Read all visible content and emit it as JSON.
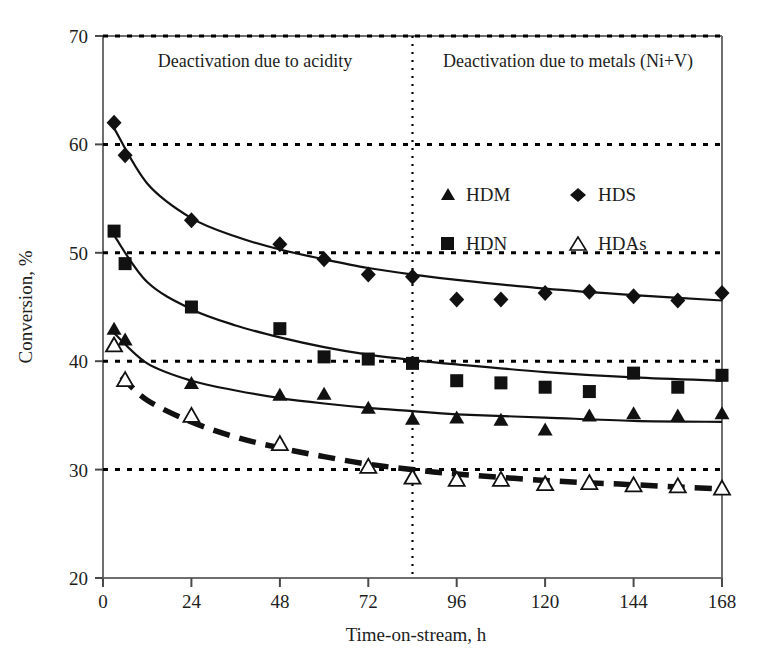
{
  "chart_data": {
    "type": "scatter",
    "title": "",
    "xlabel": "Time-on-stream, h",
    "ylabel": "Conversion, %",
    "xlim": [
      0,
      168
    ],
    "ylim": [
      20,
      70
    ],
    "xticks": [
      0,
      24,
      48,
      72,
      96,
      120,
      144,
      168
    ],
    "yticks": [
      20,
      30,
      40,
      50,
      60,
      70
    ],
    "grid": "horizontal dotted at 30, 40, 50, 60, 70",
    "legend_position": "upper-center-right",
    "annotations": [
      {
        "text": "Deactivation due to acidity",
        "x_range": [
          0,
          84
        ],
        "at_x": 42,
        "at_y": 66.5
      },
      {
        "text": "Deactivation due to metals (Ni+V)",
        "x_range": [
          84,
          168
        ],
        "at_x": 126,
        "at_y": 66.5
      }
    ],
    "divider": {
      "type": "vertical-dotted",
      "x": 84
    },
    "series": [
      {
        "name": "HDM",
        "marker": "filled-triangle",
        "trendline": "solid",
        "points": [
          {
            "x": 3,
            "y": 43.0
          },
          {
            "x": 6,
            "y": 42.0
          },
          {
            "x": 24,
            "y": 38.0
          },
          {
            "x": 48,
            "y": 36.9
          },
          {
            "x": 60,
            "y": 37.0
          },
          {
            "x": 72,
            "y": 35.7
          },
          {
            "x": 84,
            "y": 34.7
          },
          {
            "x": 96,
            "y": 34.8
          },
          {
            "x": 108,
            "y": 34.6
          },
          {
            "x": 120,
            "y": 33.7
          },
          {
            "x": 132,
            "y": 35.0
          },
          {
            "x": 144,
            "y": 35.2
          },
          {
            "x": 156,
            "y": 35.0
          },
          {
            "x": 168,
            "y": 35.2
          }
        ],
        "fit": [
          {
            "x": 3,
            "y": 42.6
          },
          {
            "x": 12,
            "y": 39.8
          },
          {
            "x": 24,
            "y": 38.2
          },
          {
            "x": 36,
            "y": 37.3
          },
          {
            "x": 48,
            "y": 36.6
          },
          {
            "x": 60,
            "y": 36.1
          },
          {
            "x": 72,
            "y": 35.7
          },
          {
            "x": 84,
            "y": 35.4
          },
          {
            "x": 96,
            "y": 35.1
          },
          {
            "x": 120,
            "y": 34.8
          },
          {
            "x": 144,
            "y": 34.5
          },
          {
            "x": 168,
            "y": 34.4
          }
        ]
      },
      {
        "name": "HDS",
        "marker": "filled-diamond",
        "trendline": "solid",
        "points": [
          {
            "x": 3,
            "y": 62.0
          },
          {
            "x": 6,
            "y": 59.0
          },
          {
            "x": 24,
            "y": 53.0
          },
          {
            "x": 48,
            "y": 50.8
          },
          {
            "x": 60,
            "y": 49.4
          },
          {
            "x": 72,
            "y": 48.0
          },
          {
            "x": 84,
            "y": 47.8
          },
          {
            "x": 96,
            "y": 45.7
          },
          {
            "x": 108,
            "y": 45.7
          },
          {
            "x": 120,
            "y": 46.3
          },
          {
            "x": 132,
            "y": 46.4
          },
          {
            "x": 144,
            "y": 46.0
          },
          {
            "x": 156,
            "y": 45.6
          },
          {
            "x": 168,
            "y": 46.3
          }
        ],
        "fit": [
          {
            "x": 3,
            "y": 61.5
          },
          {
            "x": 12,
            "y": 56.4
          },
          {
            "x": 24,
            "y": 53.2
          },
          {
            "x": 36,
            "y": 51.5
          },
          {
            "x": 48,
            "y": 50.3
          },
          {
            "x": 60,
            "y": 49.4
          },
          {
            "x": 72,
            "y": 48.6
          },
          {
            "x": 84,
            "y": 48.0
          },
          {
            "x": 96,
            "y": 47.5
          },
          {
            "x": 120,
            "y": 46.7
          },
          {
            "x": 144,
            "y": 46.1
          },
          {
            "x": 168,
            "y": 45.6
          }
        ]
      },
      {
        "name": "HDN",
        "marker": "filled-square",
        "trendline": "solid",
        "points": [
          {
            "x": 3,
            "y": 52.0
          },
          {
            "x": 6,
            "y": 49.0
          },
          {
            "x": 24,
            "y": 45.0
          },
          {
            "x": 48,
            "y": 43.0
          },
          {
            "x": 60,
            "y": 40.4
          },
          {
            "x": 72,
            "y": 40.2
          },
          {
            "x": 84,
            "y": 39.8
          },
          {
            "x": 96,
            "y": 38.2
          },
          {
            "x": 108,
            "y": 38.0
          },
          {
            "x": 120,
            "y": 37.6
          },
          {
            "x": 132,
            "y": 37.2
          },
          {
            "x": 144,
            "y": 38.9
          },
          {
            "x": 156,
            "y": 37.6
          },
          {
            "x": 168,
            "y": 38.7
          }
        ],
        "fit": [
          {
            "x": 3,
            "y": 51.6
          },
          {
            "x": 12,
            "y": 47.3
          },
          {
            "x": 24,
            "y": 44.8
          },
          {
            "x": 36,
            "y": 43.3
          },
          {
            "x": 48,
            "y": 42.2
          },
          {
            "x": 60,
            "y": 41.3
          },
          {
            "x": 72,
            "y": 40.6
          },
          {
            "x": 84,
            "y": 40.1
          },
          {
            "x": 96,
            "y": 39.7
          },
          {
            "x": 120,
            "y": 39.0
          },
          {
            "x": 144,
            "y": 38.5
          },
          {
            "x": 168,
            "y": 38.2
          }
        ]
      },
      {
        "name": "HDAs",
        "marker": "open-triangle",
        "trendline": "dashed",
        "points": [
          {
            "x": 3,
            "y": 41.5
          },
          {
            "x": 6,
            "y": 38.3
          },
          {
            "x": 24,
            "y": 35.0
          },
          {
            "x": 48,
            "y": 32.4
          },
          {
            "x": 72,
            "y": 30.3
          },
          {
            "x": 84,
            "y": 29.3
          },
          {
            "x": 96,
            "y": 29.1
          },
          {
            "x": 108,
            "y": 29.1
          },
          {
            "x": 120,
            "y": 28.7
          },
          {
            "x": 132,
            "y": 28.8
          },
          {
            "x": 144,
            "y": 28.6
          },
          {
            "x": 156,
            "y": 28.5
          },
          {
            "x": 168,
            "y": 28.3
          }
        ],
        "fit": [
          {
            "x": 5,
            "y": 38.6
          },
          {
            "x": 12,
            "y": 36.4
          },
          {
            "x": 24,
            "y": 34.4
          },
          {
            "x": 36,
            "y": 33.0
          },
          {
            "x": 48,
            "y": 32.0
          },
          {
            "x": 60,
            "y": 31.2
          },
          {
            "x": 72,
            "y": 30.5
          },
          {
            "x": 84,
            "y": 30.0
          },
          {
            "x": 96,
            "y": 29.6
          },
          {
            "x": 120,
            "y": 29.0
          },
          {
            "x": 144,
            "y": 28.6
          },
          {
            "x": 168,
            "y": 28.2
          }
        ]
      }
    ]
  },
  "axes": {
    "y_title": "Conversion, %",
    "x_title": "Time-on-stream, h",
    "y_tick_labels": [
      "70",
      "60",
      "50",
      "40",
      "30",
      "20"
    ],
    "x_tick_labels": [
      "0",
      "24",
      "48",
      "72",
      "96",
      "120",
      "144",
      "168"
    ]
  },
  "annotations": {
    "left": "Deactivation due to acidity",
    "right": "Deactivation due to metals (Ni+V)"
  },
  "legend": {
    "entries": [
      {
        "label": "HDM",
        "marker": "filled-triangle"
      },
      {
        "label": "HDS",
        "marker": "filled-diamond"
      },
      {
        "label": "HDN",
        "marker": "filled-square"
      },
      {
        "label": "HDAs",
        "marker": "open-triangle"
      }
    ]
  },
  "colors": {
    "ink": "#1d1d1d",
    "axis": "#5a5a5a",
    "grid": "#000000",
    "background": "#ffffff"
  }
}
